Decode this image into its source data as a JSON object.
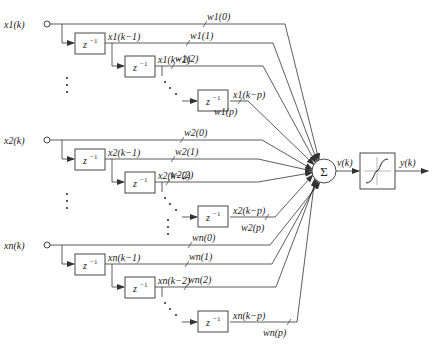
{
  "diagram": {
    "inputs": [
      {
        "name": "x1(k)",
        "sub": "1",
        "y_main": 24,
        "taps": [
          {
            "signal": "x1(k−1)",
            "weight": "w1(1)"
          },
          {
            "signal": "x1(k−2)",
            "weight": "w1(2)"
          },
          {
            "signal": "x1(k−p)",
            "weight": "w1(p)"
          }
        ],
        "weight0": "w1(0)"
      },
      {
        "name": "x2(k)",
        "sub": "2",
        "y_main": 140,
        "taps": [
          {
            "signal": "x2(k−1)",
            "weight": "w2(1)"
          },
          {
            "signal": "x2(k−2)",
            "weight": "w2(2)"
          },
          {
            "signal": "x2(k−p)",
            "weight": "w2(p)"
          }
        ],
        "weight0": "w2(0)"
      },
      {
        "name": "xn(k)",
        "sub": "n",
        "y_main": 245,
        "taps": [
          {
            "signal": "xn(k−1)",
            "weight": "wn(1)"
          },
          {
            "signal": "xn(k−2)",
            "weight": "wn(2)"
          },
          {
            "signal": "xn(k−p)",
            "weight": "wn(p)"
          }
        ],
        "weight0": "wn(0)"
      }
    ],
    "delay_label": "z",
    "delay_exp": "−1",
    "summer_label": "Σ",
    "summer_output": "v(k)",
    "activation": "sigmoid",
    "output": "y(k)",
    "colors": {
      "line": "#333333",
      "background": "#ffffff"
    }
  }
}
